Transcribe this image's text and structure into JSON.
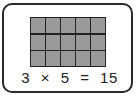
{
  "diagram": {
    "rows": 3,
    "columns": 5,
    "cell_color": "#9a9a9a",
    "border_color": "#222222",
    "equation": {
      "a": "3",
      "operator": "×",
      "b": "5",
      "equals": "=",
      "result": "15"
    }
  }
}
